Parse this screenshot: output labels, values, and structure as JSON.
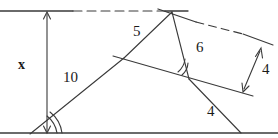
{
  "figure": {
    "type": "geometry-diagram",
    "width": 278,
    "height": 138,
    "stroke_color": "#3a3a3a",
    "background_color": "#ffffff",
    "text_color": "#1a1a1a"
  },
  "labels": {
    "height_x": "x",
    "side_5": "5",
    "side_10": "10",
    "side_6": "6",
    "side_4_lower": "4",
    "side_4_right": "4"
  },
  "label_positions": {
    "height_x": {
      "x": 18,
      "y": 58
    },
    "side_5": {
      "x": 133,
      "y": 24
    },
    "side_10": {
      "x": 63,
      "y": 70
    },
    "side_6": {
      "x": 196,
      "y": 40
    },
    "side_4_lower": {
      "x": 207,
      "y": 104
    },
    "side_4_right": {
      "x": 262,
      "y": 62
    }
  },
  "geometry": {
    "points": {
      "apex": {
        "x": 172,
        "y": 12
      },
      "bottom_left": {
        "x": 30,
        "y": 134
      },
      "bottom_right": {
        "x": 241,
        "y": 133
      },
      "mid_left": {
        "x": 124,
        "y": 58
      },
      "inner_vertex": {
        "x": 189,
        "y": 79
      },
      "right_end": {
        "x": 272,
        "y": 45
      },
      "transversal_end": {
        "x": 233,
        "y": 96
      },
      "top_solid_end": {
        "x": 72,
        "y": 11
      },
      "top_line_start": {
        "x": 0,
        "y": 11
      },
      "baseline_start": {
        "x": 0,
        "y": 133
      },
      "baseline_end": {
        "x": 278,
        "y": 133
      }
    },
    "arrows": {
      "height_arrow": {
        "x1": 47,
        "y1": 12,
        "x2": 47,
        "y2": 133,
        "double": true
      },
      "right_arrow": {
        "x1": 244,
        "y1": 90,
        "x2": 261,
        "y2": 50,
        "double": true
      }
    },
    "angle_marks": [
      {
        "name": "bottom-left-angle",
        "vertex_x": 30,
        "vertex_y": 134,
        "arcs": 2
      },
      {
        "name": "inner-vertex-angle",
        "vertex_x": 189,
        "vertex_y": 79,
        "arcs": 2
      }
    ],
    "dashed_segments": [
      {
        "name": "top-dashed",
        "x1": 72,
        "y1": 11,
        "x2": 166,
        "y2": 11
      },
      {
        "name": "upper-right-dashed",
        "x1": 195,
        "y1": 22,
        "x2": 243,
        "y2": 34
      }
    ]
  }
}
